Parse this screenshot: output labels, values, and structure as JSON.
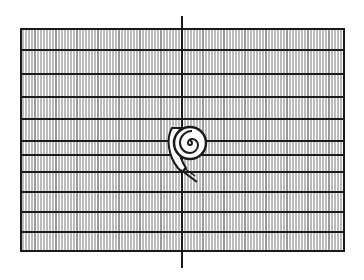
{
  "figure": {
    "colors": {
      "background": "#ffffff",
      "ink": "#1a1a1a",
      "hatch": "#555555"
    },
    "grid": {
      "left": 21,
      "right": 344,
      "top": 29,
      "bottom": 251,
      "horizontal_lines_y": [
        29,
        50,
        74,
        97,
        119,
        141,
        155,
        172,
        192,
        212,
        232,
        251
      ],
      "hatch_spacing": 3
    },
    "axis_line": {
      "x": 182,
      "y_top": 16,
      "y_bottom": 268
    },
    "spiral": {
      "cx": 190,
      "cy": 143,
      "r": 15
    }
  }
}
